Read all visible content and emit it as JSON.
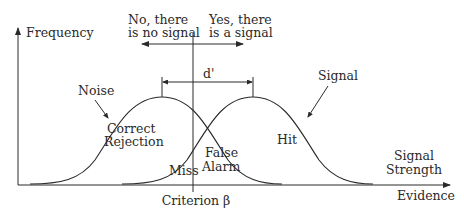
{
  "diagram": {
    "axes": {
      "y_label": "Frequency",
      "x_label_line1": "Signal",
      "x_label_line2": "Strength",
      "x_sublabel": "Evidence"
    },
    "curves": {
      "noise_label": "Noise",
      "signal_label": "Signal"
    },
    "criterion": {
      "label": "Criterion β"
    },
    "decisions": {
      "no_line1": "No, there",
      "no_line2": "is no signal",
      "yes_line1": "Yes, there",
      "yes_line2": "is a signal"
    },
    "separation": {
      "label": "d'"
    },
    "regions": {
      "correct_rejection_line1": "Correct",
      "correct_rejection_line2": "Rejection",
      "miss": "Miss",
      "false_alarm_line1": "False",
      "false_alarm_line2": "Alarm",
      "hit": "Hit"
    },
    "colors": {
      "line": "#2a2a2a",
      "background": "#ffffff"
    }
  }
}
